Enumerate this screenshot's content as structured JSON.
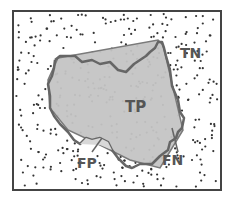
{
  "diagram": {
    "type": "segmentation-confusion-regions",
    "labels": {
      "tp": "TP",
      "tn": "TN",
      "fp": "FP",
      "fn": "FN"
    },
    "colors": {
      "background": "#ffffff",
      "frame": "#444444",
      "dots": "#333333",
      "region_fill": "#c4c4c4",
      "predicted_outline": "#777777",
      "truth_outline": "#666666",
      "label": "#555555"
    },
    "frame": {
      "x": 13,
      "y": 11,
      "width": 208,
      "height": 179
    }
  }
}
